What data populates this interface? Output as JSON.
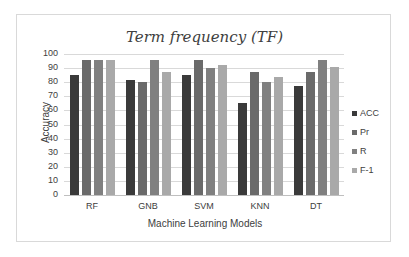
{
  "chart_data": {
    "type": "bar",
    "title": "Term frequency (TF)",
    "xlabel": "Machine Learning Models",
    "ylabel": "Accuracy",
    "ylim": [
      0,
      100
    ],
    "yticks": [
      0,
      10,
      20,
      30,
      40,
      50,
      60,
      70,
      80,
      90,
      100
    ],
    "grid": true,
    "legend_position": "right",
    "categories": [
      "RF",
      "GNB",
      "SVM",
      "KNN",
      "DT"
    ],
    "series": [
      {
        "name": "ACC",
        "color": "#3a3a3a",
        "values": [
          85,
          81.5,
          85,
          65.5,
          77.5
        ]
      },
      {
        "name": "Pr",
        "color": "#6a6a6a",
        "values": [
          95.5,
          80,
          95.5,
          87.5,
          87
        ]
      },
      {
        "name": "R",
        "color": "#808080",
        "values": [
          95.5,
          95.5,
          90,
          80,
          95.5
        ]
      },
      {
        "name": "F-1",
        "color": "#a9a9a9",
        "values": [
          95.5,
          87,
          92,
          84,
          91
        ]
      }
    ]
  }
}
